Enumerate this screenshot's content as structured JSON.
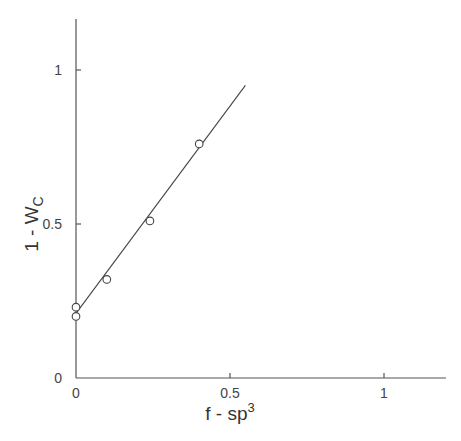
{
  "chart_data": {
    "type": "scatter",
    "title": "",
    "xlabel": "f - sp3",
    "xlabel_base": "f - sp",
    "xlabel_sup": "3",
    "ylabel": "1 - Wc",
    "ylabel_base": "1 - W",
    "ylabel_sub": "C",
    "xlim": [
      0,
      1.2
    ],
    "ylim": [
      0,
      1.17
    ],
    "x_ticks": [
      0,
      0.5,
      1
    ],
    "x_tick_labels": [
      "0",
      "0.5",
      "1"
    ],
    "y_ticks": [
      0,
      0.5,
      1
    ],
    "y_tick_labels": [
      "0",
      "0.5",
      "1"
    ],
    "grid": false,
    "legend": null,
    "series": [
      {
        "name": "data",
        "marker": "open-circle",
        "x": [
          0.0,
          0.0,
          0.1,
          0.24,
          0.4
        ],
        "y": [
          0.2,
          0.23,
          0.32,
          0.51,
          0.76
        ]
      },
      {
        "name": "fit",
        "type": "line",
        "x": [
          0.0,
          0.55
        ],
        "y": [
          0.21,
          0.95
        ]
      }
    ]
  }
}
